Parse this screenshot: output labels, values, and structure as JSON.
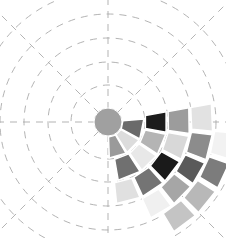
{
  "chart_data": {
    "type": "heatmap",
    "subtype": "polar",
    "title": "",
    "xlabel": "",
    "ylabel": "",
    "grid": true,
    "legend": null,
    "center": {
      "x": 108,
      "y": 122
    },
    "center_disc": {
      "radius": 14,
      "color": "#a0a0a0"
    },
    "grid_rings": [
      37,
      60,
      84,
      108,
      132
    ],
    "grid_spokes_deg": [
      0,
      45,
      90,
      135,
      180,
      225,
      270,
      315
    ],
    "grid_color": "#aaaaaa",
    "rings": [
      {
        "r0": 15,
        "r1": 36,
        "cells": [
          {
            "a0": -5,
            "a1": 28,
            "color": "#6a6a6a"
          },
          {
            "a0": 30,
            "a1": 58,
            "color": "#dcdcdc"
          },
          {
            "a0": 60,
            "a1": 88,
            "color": "#9a9a9a"
          }
        ]
      },
      {
        "r0": 38,
        "r1": 59,
        "cells": [
          {
            "a0": -10,
            "a1": 10,
            "color": "#1c1c1c"
          },
          {
            "a0": 12,
            "a1": 33,
            "color": "#b4b4b4"
          },
          {
            "a0": 35,
            "a1": 55,
            "color": "#e8e8e8"
          },
          {
            "a0": 57,
            "a1": 80,
            "color": "#707070"
          }
        ]
      },
      {
        "r0": 61,
        "r1": 82,
        "cells": [
          {
            "a0": -10,
            "a1": 8,
            "color": "#9c9c9c"
          },
          {
            "a0": 10,
            "a1": 27,
            "color": "#d8d8d8"
          },
          {
            "a0": 29,
            "a1": 46,
            "color": "#1a1a1a"
          },
          {
            "a0": 48,
            "a1": 65,
            "color": "#747474"
          },
          {
            "a0": 67,
            "a1": 84,
            "color": "#e0e0e0"
          }
        ]
      },
      {
        "r0": 84,
        "r1": 105,
        "cells": [
          {
            "a0": -10,
            "a1": 5,
            "color": "#e2e2e2"
          },
          {
            "a0": 7,
            "a1": 21,
            "color": "#8c8c8c"
          },
          {
            "a0": 23,
            "a1": 36,
            "color": "#5a5a5a"
          },
          {
            "a0": 38,
            "a1": 51,
            "color": "#a6a6a6"
          },
          {
            "a0": 53,
            "a1": 66,
            "color": "#f0f0f0"
          }
        ]
      },
      {
        "r0": 107,
        "r1": 128,
        "cells": [
          {
            "a0": 5,
            "a1": 17,
            "color": "#f2f2f2"
          },
          {
            "a0": 19,
            "a1": 31,
            "color": "#7c7c7c"
          },
          {
            "a0": 33,
            "a1": 45,
            "color": "#b8b8b8"
          },
          {
            "a0": 47,
            "a1": 59,
            "color": "#c4c4c4"
          }
        ]
      }
    ]
  }
}
